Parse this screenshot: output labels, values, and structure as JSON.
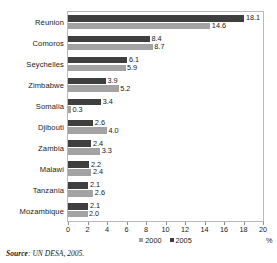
{
  "chart_data": {
    "type": "bar",
    "orientation": "horizontal",
    "title": "",
    "xlabel": "%",
    "ylabel": "",
    "xlim": [
      0,
      20
    ],
    "xticks": [
      0,
      2,
      4,
      6,
      8,
      10,
      12,
      14,
      16,
      18,
      20
    ],
    "grid": false,
    "legend_position": "bottom-center",
    "categories": [
      "Réunion",
      "Comoros",
      "Seychelles",
      "Zimbabwe",
      "Somalia",
      "Djibouti",
      "Zambia",
      "Malawi",
      "Tanzania",
      "Mozambique"
    ],
    "series": [
      {
        "name": "2005",
        "color": "#3f3f3f",
        "values": [
          18.1,
          8.4,
          6.1,
          3.9,
          3.4,
          2.6,
          2.4,
          2.2,
          2.1,
          2.1
        ]
      },
      {
        "name": "2000",
        "color": "#a3a3a3",
        "values": [
          14.6,
          8.7,
          5.9,
          5.2,
          0.3,
          4.0,
          3.3,
          2.4,
          2.6,
          2.0
        ]
      }
    ],
    "value_labels": {
      "2005": [
        "18.1",
        "8.4",
        "6.1",
        "3.9",
        "3.4",
        "2.6",
        "2.4",
        "2.2",
        "2.1",
        "2.1"
      ],
      "2000": [
        "14.6",
        "8.7",
        "5.9",
        "5.2",
        "0.3",
        "4.0",
        "3.3",
        "2.4",
        "2.6",
        "2.0"
      ]
    }
  },
  "legend": {
    "items": [
      {
        "label": "2000",
        "color": "#a3a3a3"
      },
      {
        "label": "2005",
        "color": "#3f3f3f"
      }
    ]
  },
  "axis": {
    "unit": "%",
    "tick_labels": [
      "0",
      "2",
      "4",
      "6",
      "8",
      "10",
      "12",
      "14",
      "16",
      "18",
      "20"
    ]
  },
  "source": {
    "label": "Source",
    "separator": ":",
    "text": " UN DESA, 2005."
  }
}
